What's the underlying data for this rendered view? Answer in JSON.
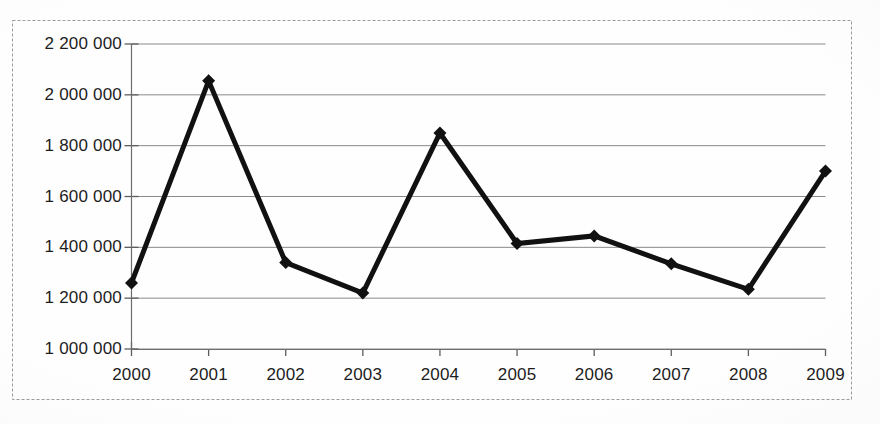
{
  "chart_data": {
    "type": "line",
    "title": "",
    "subtitle": "",
    "xlabel": "",
    "ylabel": "",
    "categories": [
      "2000",
      "2001",
      "2002",
      "2003",
      "2004",
      "2005",
      "2006",
      "2007",
      "2008",
      "2009"
    ],
    "values": [
      1260000,
      2055000,
      1340000,
      1220000,
      1850000,
      1415000,
      1445000,
      1335000,
      1235000,
      1700000
    ],
    "series": [
      {
        "name": "",
        "values": [
          1260000,
          2055000,
          1340000,
          1220000,
          1850000,
          1415000,
          1445000,
          1335000,
          1235000,
          1700000
        ]
      }
    ],
    "ylim": [
      1000000,
      2200000
    ],
    "ytick_values": [
      1000000,
      1200000,
      1400000,
      1600000,
      1800000,
      2000000,
      2200000
    ],
    "ytick_labels": [
      "1 000 000",
      "1 200 000",
      "1 400 000",
      "1 600 000",
      "1 800 000",
      "2 000 000",
      "2 200 000"
    ],
    "xtick_labels": [
      "2000",
      "2001",
      "2002",
      "2003",
      "2004",
      "2005",
      "2006",
      "2007",
      "2008",
      "2009"
    ],
    "grid": true,
    "grid_axis": "y",
    "legend": false,
    "legend_position": "none",
    "marker": "diamond",
    "line_color": "#111111",
    "marker_color": "#111111",
    "grid_color": "#8a8a8a",
    "border_color": "#9a9a9a",
    "background_color": "#ffffff",
    "text_color": "#1d1d1d",
    "line_width": 5,
    "annotations": []
  }
}
